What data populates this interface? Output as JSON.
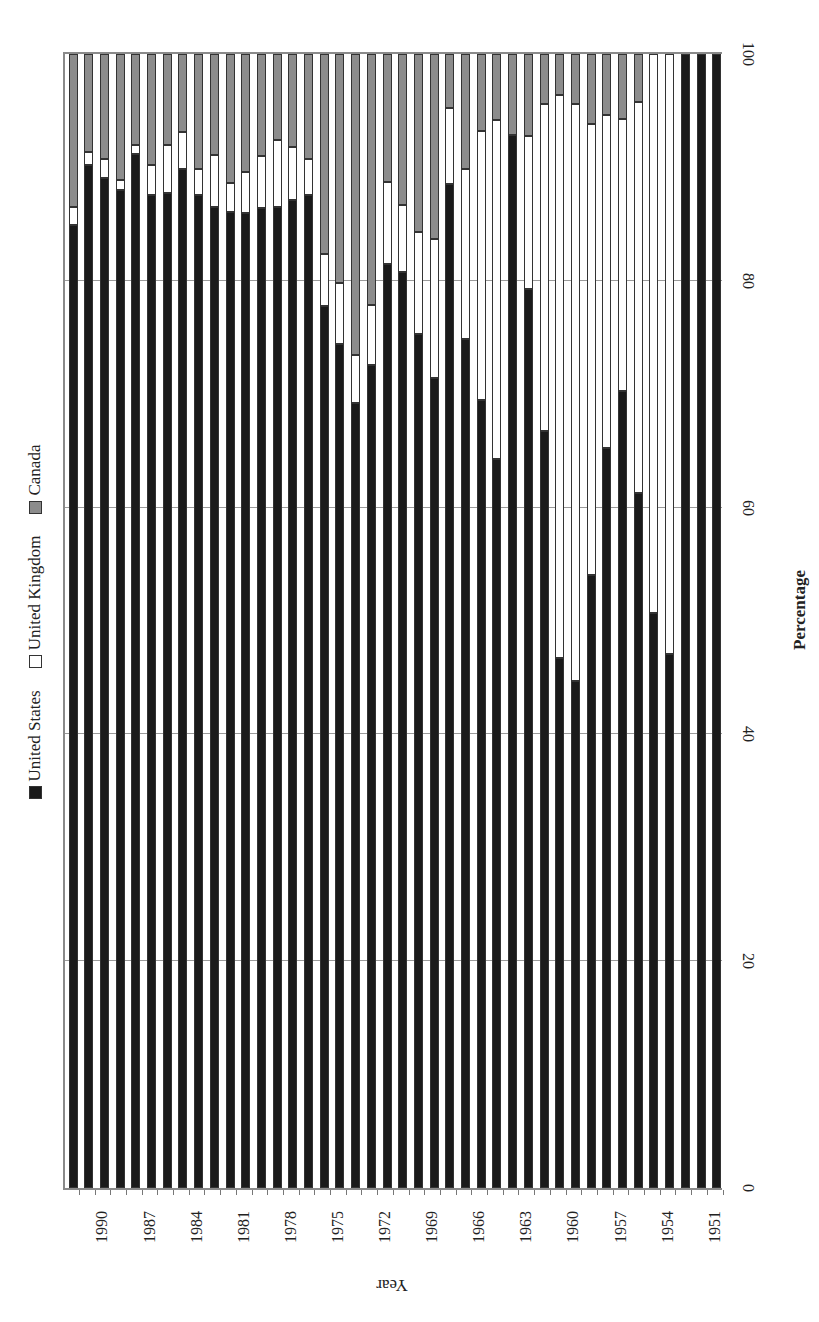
{
  "chart_data": {
    "type": "bar",
    "stacked": true,
    "orientation": "vertical (page rotated 90°)",
    "title": "",
    "xlabel": "Year",
    "ylabel": "Percentage",
    "ylim": [
      0,
      100
    ],
    "yticks": [
      "0",
      "20",
      "40",
      "60",
      "80",
      "100"
    ],
    "xtick_labels": [
      "1990",
      "1987",
      "1984",
      "1981",
      "1978",
      "1975",
      "1972",
      "1969",
      "1966",
      "1963",
      "1960",
      "1957",
      "1954",
      "1951"
    ],
    "grid": true,
    "legend_position": "top",
    "categories": [
      1992,
      1991,
      1990,
      1989,
      1988,
      1987,
      1986,
      1985,
      1984,
      1983,
      1982,
      1981,
      1980,
      1979,
      1978,
      1977,
      1976,
      1975,
      1974,
      1973,
      1972,
      1971,
      1970,
      1969,
      1968,
      1967,
      1966,
      1965,
      1964,
      1963,
      1962,
      1961,
      1960,
      1959,
      1958,
      1957,
      1956,
      1955,
      1954,
      1953,
      1952,
      1951
    ],
    "series": [
      {
        "name": "United States",
        "color": "#1a1a1a",
        "values": [
          84.9,
          90.2,
          89.1,
          88.0,
          91.2,
          87.6,
          87.7,
          89.9,
          87.6,
          86.5,
          86.1,
          86.0,
          86.4,
          86.5,
          87.1,
          87.6,
          77.8,
          74.4,
          69.2,
          72.6,
          81.5,
          80.8,
          75.3,
          71.4,
          88.5,
          74.9,
          69.5,
          64.3,
          92.9,
          79.3,
          66.8,
          46.7,
          44.7,
          54.1,
          65.3,
          70.3,
          61.3,
          50.7,
          47.1,
          100,
          100,
          100
        ]
      },
      {
        "name": "United Kingdom",
        "color": "#ffffff",
        "values": [
          1.6,
          1.2,
          1.6,
          0.9,
          0.8,
          2.6,
          4.3,
          3.2,
          2.3,
          4.6,
          2.5,
          3.6,
          4.6,
          5.9,
          4.7,
          3.1,
          4.6,
          5.4,
          4.3,
          5.3,
          7.2,
          5.9,
          9.0,
          12.3,
          6.7,
          15.0,
          23.7,
          29.9,
          0.0,
          13.5,
          28.8,
          49.7,
          50.9,
          39.7,
          29.3,
          24.0,
          34.5,
          49.3,
          52.9,
          0,
          0,
          0
        ]
      },
      {
        "name": "Canada",
        "color": "#8c8c8c",
        "values": [
          13.5,
          8.6,
          9.3,
          11.1,
          8.0,
          9.8,
          8.0,
          6.9,
          10.1,
          8.9,
          11.4,
          10.4,
          9.0,
          7.6,
          8.2,
          9.3,
          17.6,
          20.2,
          26.5,
          22.1,
          11.3,
          13.3,
          15.7,
          16.3,
          4.8,
          10.1,
          6.8,
          5.8,
          7.1,
          7.2,
          4.4,
          3.6,
          4.4,
          6.2,
          5.4,
          5.7,
          4.2,
          0,
          0,
          0,
          0,
          0
        ]
      }
    ]
  },
  "legend": {
    "items": [
      {
        "label": "United States",
        "color": "#1a1a1a"
      },
      {
        "label": "United Kingdom",
        "color": "#ffffff"
      },
      {
        "label": "Canada",
        "color": "#8c8c8c"
      }
    ]
  }
}
